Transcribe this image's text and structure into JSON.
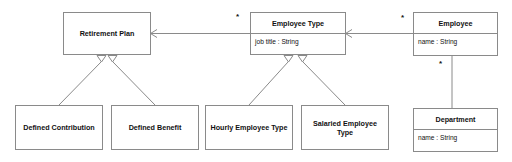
{
  "diagram": {
    "type": "uml-class-diagram",
    "width": 512,
    "height": 162,
    "background_color": "#ffffff",
    "line_color": "#8a8a8a",
    "text_color": "#111111"
  },
  "classes": {
    "retirement_plan": {
      "name": "Retirement Plan",
      "attributes": []
    },
    "defined_contribution": {
      "name": "Defined Contribution",
      "attributes": []
    },
    "defined_benefit": {
      "name": "Defined Benefit",
      "attributes": []
    },
    "employee_type": {
      "name": "Employee Type",
      "attributes": [
        "job title : String"
      ]
    },
    "hourly_employee_type": {
      "name": "Hourly Employee Type",
      "attributes": []
    },
    "salaried_employee_type": {
      "name": "Salaried Employee Type",
      "attributes": []
    },
    "employee": {
      "name": "Employee",
      "attributes": [
        "name : String"
      ]
    },
    "department": {
      "name": "Department",
      "attributes": [
        "name : String"
      ]
    }
  },
  "multiplicities": {
    "employee_type_to_retirement_plan": "*",
    "employee_to_employee_type": "*",
    "employee_to_department": "*"
  }
}
